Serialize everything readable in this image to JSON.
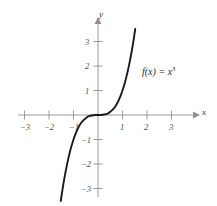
{
  "figure": {
    "background_color": "#ffffff",
    "curve_color": "#1a1a1a",
    "axis_color": "#9a9a9a",
    "label_color": "#4a4a4a"
  },
  "axes": {
    "x_name": "x",
    "y_name": "y",
    "x_ticks": [
      {
        "value": -3,
        "label": "−3"
      },
      {
        "value": -2,
        "label": "−2"
      },
      {
        "value": -1,
        "label": "−1"
      },
      {
        "value": 1,
        "label": "1"
      },
      {
        "value": 2,
        "label": "2"
      },
      {
        "value": 3,
        "label": "3"
      }
    ],
    "y_ticks": [
      {
        "value": 3,
        "label": "3"
      },
      {
        "value": 2,
        "label": "2"
      },
      {
        "value": 1,
        "label": "1"
      },
      {
        "value": -1,
        "label": "−1"
      },
      {
        "value": -2,
        "label": "−2"
      },
      {
        "value": -3,
        "label": "−3"
      }
    ]
  },
  "annotation": {
    "function_label_base": "f(x) = x",
    "function_label_exponent": "3"
  },
  "chart_data": {
    "type": "line",
    "title": "",
    "xlabel": "x",
    "ylabel": "y",
    "xlim": [
      -3.6,
      3.6
    ],
    "ylim": [
      -3.6,
      3.6
    ],
    "grid": false,
    "legend": "none",
    "annotations": [
      {
        "text": "f(x) = x^3",
        "x": 1.75,
        "y": 2.0
      }
    ],
    "series": [
      {
        "name": "f(x) = x^3",
        "expression": "x^3",
        "color": "#1a1a1a",
        "x": [
          -1.52,
          -1.45,
          -1.4,
          -1.35,
          -1.3,
          -1.2,
          -1.1,
          -1.0,
          -0.9,
          -0.8,
          -0.7,
          -0.6,
          -0.5,
          -0.4,
          -0.3,
          -0.2,
          -0.1,
          0.0,
          0.1,
          0.2,
          0.3,
          0.4,
          0.5,
          0.6,
          0.7,
          0.8,
          0.9,
          1.0,
          1.1,
          1.2,
          1.3,
          1.35,
          1.4,
          1.45,
          1.52
        ],
        "y": [
          -3.51,
          -3.05,
          -2.74,
          -2.46,
          -2.2,
          -1.73,
          -1.33,
          -1.0,
          -0.73,
          -0.51,
          -0.34,
          -0.22,
          -0.13,
          -0.06,
          -0.03,
          -0.01,
          -0.001,
          0.0,
          0.001,
          0.01,
          0.03,
          0.06,
          0.13,
          0.22,
          0.34,
          0.51,
          0.73,
          1.0,
          1.33,
          1.73,
          2.2,
          2.46,
          2.74,
          3.05,
          3.51
        ]
      }
    ]
  }
}
